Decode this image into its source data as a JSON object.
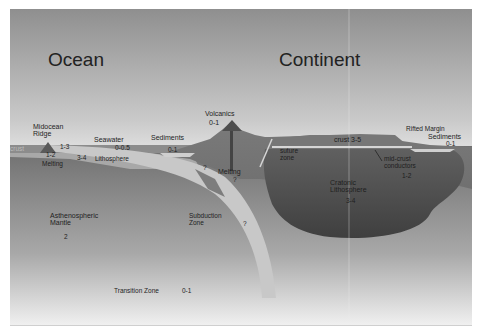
{
  "diagram": {
    "title_left": "Ocean",
    "title_right": "Continent",
    "labels": {
      "midocean_ridge": "Midocean\nRidge",
      "ridge_value": "1-3",
      "ridge_value2": "1-2",
      "ridge_melting": "Melting",
      "crust_left": "crust",
      "seawater": "Seawater",
      "seawater_value": "0-0.5",
      "lithosphere_value": "3-4",
      "lithosphere": "Lithosphere",
      "sediments_left": "Sediments",
      "sediments_left_value": "0-1",
      "volcanics": "Volcanics",
      "volcanics_value": "0-1",
      "melting": "Melting",
      "melting_value": "?",
      "wedge_value": "?",
      "suture_zone": "suture\nzone",
      "crust_right": "crust  3-5",
      "rifted_margin": "Rifted Margin",
      "sediments_right": "Sediments",
      "sediments_right_value": "0-1",
      "midcrust_conductors": "mid-crust\nconductors",
      "midcrust_value": "1-2",
      "cratonic_lithosphere": "Cratonic\nLithosphere",
      "cratonic_value": "3-4",
      "asthenospheric_mantle": "Asthenospheric\nMantle",
      "asthenosphere_value": "2",
      "subduction_zone": "Subduction\nZone",
      "subduction_value": "?",
      "transition_zone": "Transition Zone",
      "transition_value": "0-1"
    },
    "colors": {
      "sky_top": "#8f8f8f",
      "sky_bottom": "#e3e3e3",
      "ocean_water": "#8a8a8a",
      "slab": "#c4c4c4",
      "continent": "#6f6f6f",
      "craton": "#555555",
      "mantle_bottom": "#f2f2f2"
    }
  }
}
